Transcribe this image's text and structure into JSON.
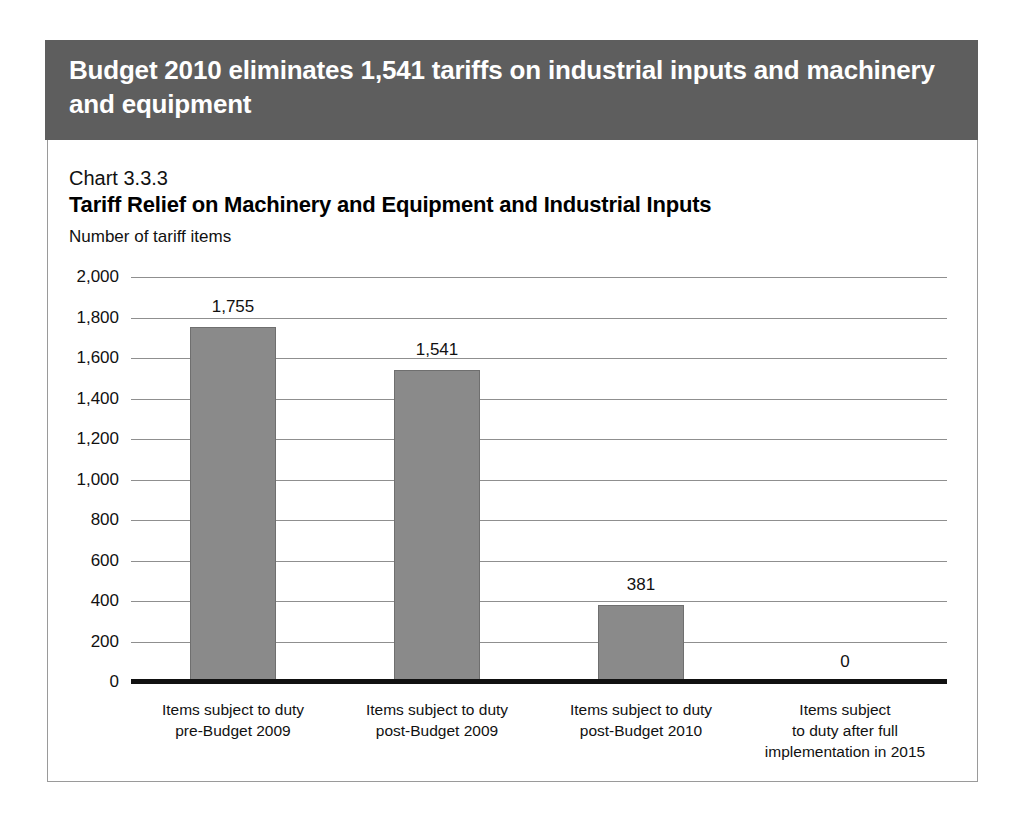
{
  "banner": {
    "title": "Budget 2010 eliminates 1,541 tariffs on industrial inputs and machinery and equipment"
  },
  "chart_number": "Chart 3.3.3",
  "chart_data": {
    "type": "bar",
    "title": "Tariff Relief on Machinery and Equipment and Industrial Inputs",
    "subtitle": "Chart 3.3.3",
    "ylabel": "Number of tariff items",
    "xlabel": "",
    "categories": [
      "Items subject to duty\npre-Budget 2009",
      "Items subject to duty\npost-Budget 2009",
      "Items subject to duty\npost-Budget 2010",
      "Items subject\nto duty after full\nimplementation in 2015"
    ],
    "values": [
      1755,
      1541,
      381,
      0
    ],
    "value_labels": [
      "1,755",
      "1,541",
      "381",
      "0"
    ],
    "ylim": [
      0,
      2000
    ],
    "ytick_values": [
      2000,
      1800,
      1600,
      1400,
      1200,
      1000,
      800,
      600,
      400,
      200,
      0
    ],
    "ytick_labels": [
      "2,000",
      "1,800",
      "1,600",
      "1,400",
      "1,200",
      "1,000",
      "800",
      "600",
      "400",
      "200",
      "0"
    ],
    "grid": true,
    "legend": "none",
    "bar_color": "#8a8a8a",
    "bar_edge_color": "#6f6f6f",
    "axis_color": "#111111",
    "gridline_color": "#8f8f8f",
    "banner_color": "#5e5e5e"
  }
}
